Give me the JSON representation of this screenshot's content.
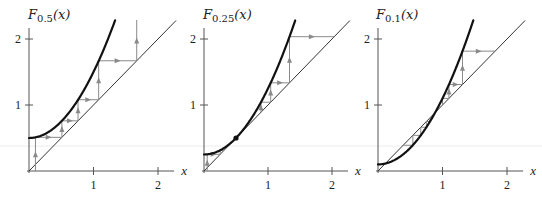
{
  "figure": {
    "background": "#ffffff",
    "colors": {
      "curve": "#111111",
      "diagonal": "#333333",
      "cobweb": "#8a8a8a",
      "axis": "#555555"
    },
    "panels": [
      {
        "id": "p1",
        "title_main": "F",
        "title_sub": "0.5",
        "title_arg": "(x)",
        "c": 0.5,
        "x_axis_label": "x",
        "x_ticks": [
          "1",
          "2"
        ],
        "y_ticks": [
          "1",
          "2"
        ],
        "fixed_points": [],
        "cobweb_orbit": [
          0.1,
          0.51,
          0.76,
          1.08,
          1.67,
          3.28
        ],
        "origin": [
          29,
          171
        ],
        "sx": 64.5,
        "sy": 66
      },
      {
        "id": "p2",
        "title_main": "F",
        "title_sub": "0.25",
        "title_arg": "(x)",
        "c": 0.25,
        "x_axis_label": "x",
        "x_ticks": [
          "1",
          "2"
        ],
        "y_ticks": [
          "1",
          "2"
        ],
        "fixed_points": [
          0.5
        ],
        "cobweb_orbit_left": [
          0.05,
          0.2525,
          0.3138
        ],
        "cobweb_orbit_right": [
          0.89,
          1.042,
          1.336,
          2.035
        ],
        "origin": [
          204,
          171
        ],
        "sx": 64,
        "sy": 66
      },
      {
        "id": "p3",
        "title_main": "F",
        "title_sub": "0.1",
        "title_arg": "(x)",
        "c": 0.1,
        "x_axis_label": "x",
        "x_ticks": [
          "1",
          "2"
        ],
        "y_ticks": [
          "1",
          "2"
        ],
        "fixed_points": [
          0.113,
          0.887
        ],
        "cobweb_orbit_left": [
          0.86,
          0.84,
          0.806,
          0.75,
          0.663,
          0.54,
          0.39
        ],
        "cobweb_orbit_right": [
          1.0,
          1.1,
          1.31,
          1.816
        ],
        "origin": [
          378,
          171
        ],
        "sx": 64.5,
        "sy": 66
      }
    ]
  }
}
